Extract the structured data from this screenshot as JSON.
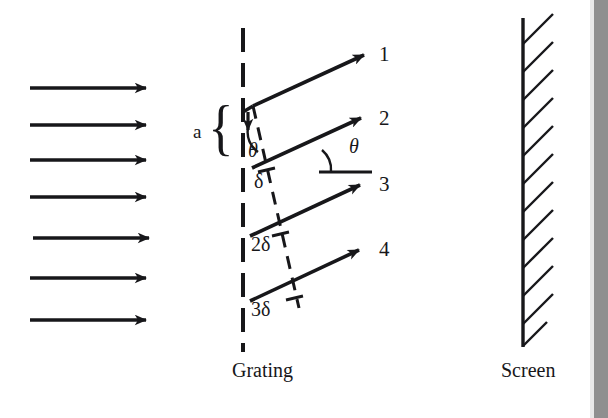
{
  "figure": {
    "title_not_shown": "",
    "background_color": "#ffffff",
    "ink_color": "#17171a",
    "edge_band_color": "#8f8f8f",
    "incoming_beam": {
      "description": "plane wavefront arrows travelling left to right",
      "arrow_count": 7,
      "direction": "right",
      "x_start": 30,
      "x_end": 148,
      "y_positions": [
        88,
        125,
        160,
        197,
        238,
        278,
        320
      ]
    },
    "grating": {
      "label": "Grating",
      "label_x": 238,
      "label_y": 372,
      "line_x": 243,
      "line_top": 28,
      "line_bottom": 352,
      "style": "dashed-vertical",
      "dash_pattern": "22 10"
    },
    "screen": {
      "label": "Screen",
      "label_x": 506,
      "label_y": 372,
      "line_x": 523,
      "line_top": 18,
      "line_bottom": 347,
      "style": "solid-vertical-with-hatching",
      "hatch_count": 12,
      "hatch_direction": "up-right"
    },
    "rays": [
      {
        "label": "1",
        "origin_x": 253,
        "origin_y": 106,
        "tip_x": 366,
        "tip_y": 54,
        "label_x": 381,
        "label_y": 45
      },
      {
        "label": "2",
        "origin_x": 252,
        "origin_y": 168,
        "tip_x": 363,
        "tip_y": 117,
        "label_x": 381,
        "label_y": 111
      },
      {
        "label": "3",
        "origin_x": 250,
        "origin_y": 236,
        "tip_x": 362,
        "tip_y": 184,
        "label_x": 381,
        "label_y": 177
      },
      {
        "label": "4",
        "origin_x": 250,
        "origin_y": 301,
        "tip_x": 361,
        "tip_y": 249,
        "label_x": 381,
        "label_y": 242
      }
    ],
    "wavefront": {
      "description": "dashed line perpendicular to diffracted rays marking path differences",
      "from_x": 253,
      "from_y": 106,
      "to_x": 299,
      "to_y": 308,
      "style": "dashed",
      "tick_marks": 3
    },
    "labels": {
      "slit_spacing": "a",
      "slit_spacing_x": 196,
      "slit_spacing_y": 132,
      "brace_x": 212,
      "brace_y": 104,
      "path_diff_1": "δ",
      "path_diff_1_x": 259,
      "path_diff_1_y": 181,
      "path_diff_2": "2δ",
      "path_diff_2_x": 259,
      "path_diff_2_y": 245,
      "path_diff_3": "3δ",
      "path_diff_3_x": 259,
      "path_diff_3_y": 309,
      "angle_at_grating": "θ",
      "angle_at_grating_x": 250,
      "angle_at_grating_y": 150,
      "angle_at_ray": "θ",
      "angle_at_ray_x": 353,
      "angle_at_ray_y": 146,
      "reference_line": {
        "x1": 319,
        "x2": 372,
        "y": 172
      }
    }
  }
}
